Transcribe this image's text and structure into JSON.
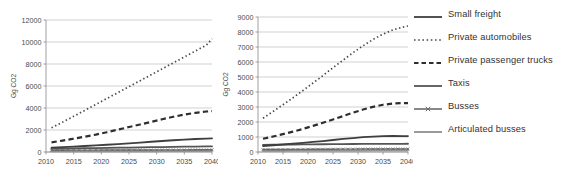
{
  "figure": {
    "panels": [
      {
        "id": "left",
        "ylabel": "Gg CO2",
        "ylim": [
          0,
          12000
        ],
        "yticks": [
          "0",
          "2000",
          "4000",
          "6000",
          "8000",
          "10000",
          "12000"
        ],
        "ytick_values": [
          0,
          2000,
          4000,
          6000,
          8000,
          10000,
          12000
        ],
        "xticks": [
          "2010",
          "2015",
          "2020",
          "2025",
          "2030",
          "2035",
          "2040"
        ],
        "xtick_values": [
          2010,
          2015,
          2020,
          2025,
          2030,
          2035,
          2040
        ],
        "xlim": [
          2010,
          2040
        ]
      },
      {
        "id": "right",
        "ylabel": "Gg CO2",
        "ylim": [
          0,
          9000
        ],
        "yticks": [
          "0",
          "1000",
          "2000",
          "3000",
          "4000",
          "5000",
          "6000",
          "7000",
          "8000",
          "9000"
        ],
        "ytick_values": [
          0,
          1000,
          2000,
          3000,
          4000,
          5000,
          6000,
          7000,
          8000,
          9000
        ],
        "xticks": [
          "2010",
          "2015",
          "2020",
          "2025",
          "2030",
          "2035",
          "2040"
        ],
        "xtick_values": [
          2010,
          2015,
          2020,
          2025,
          2030,
          2035,
          2040
        ],
        "xlim": [
          2010,
          2040
        ]
      }
    ]
  },
  "legend": {
    "position": "right",
    "items": [
      {
        "label": "Small freight",
        "style": "solid",
        "color": "#3f3f3f",
        "width": 1.8,
        "marker": "none"
      },
      {
        "label": "Private automobiles",
        "style": "dotted",
        "color": "#4a4a4a",
        "width": 1.7,
        "marker": "none"
      },
      {
        "label": "Private passenger trucks",
        "style": "dashed",
        "color": "#2e2e2e",
        "width": 2.2,
        "marker": "none"
      },
      {
        "label": "Taxis",
        "style": "solid",
        "color": "#555555",
        "width": 1.8,
        "marker": "none"
      },
      {
        "label": "Busses",
        "style": "solid",
        "color": "#6b6b6b",
        "width": 1.4,
        "marker": "cross"
      },
      {
        "label": "Articulated busses",
        "style": "solid",
        "color": "#9a9a9a",
        "width": 2.0,
        "marker": "none"
      }
    ]
  },
  "chart_data": [
    {
      "type": "line",
      "panel": "left",
      "title": "",
      "xlabel": "",
      "ylabel": "Gg CO2",
      "xlim": [
        2010,
        2040
      ],
      "ylim": [
        0,
        12000
      ],
      "grid": true,
      "legend_position": "right",
      "x": [
        2011,
        2013,
        2015,
        2017,
        2019,
        2021,
        2023,
        2025,
        2027,
        2029,
        2031,
        2033,
        2035,
        2037,
        2039,
        2040
      ],
      "series": [
        {
          "name": "Private automobiles",
          "values": [
            2200,
            2720,
            3240,
            3780,
            4320,
            4860,
            5400,
            5940,
            6480,
            7020,
            7560,
            8100,
            8640,
            9180,
            9720,
            10300
          ]
        },
        {
          "name": "Private passenger trucks",
          "values": [
            880,
            1040,
            1210,
            1390,
            1580,
            1800,
            2030,
            2270,
            2500,
            2740,
            2980,
            3200,
            3400,
            3560,
            3680,
            3720
          ]
        },
        {
          "name": "Small freight",
          "values": [
            390,
            440,
            490,
            545,
            600,
            660,
            720,
            790,
            860,
            930,
            1000,
            1070,
            1130,
            1180,
            1220,
            1240
          ]
        },
        {
          "name": "Taxis",
          "values": [
            300,
            315,
            330,
            345,
            360,
            375,
            390,
            405,
            420,
            435,
            450,
            465,
            480,
            495,
            505,
            510
          ]
        },
        {
          "name": "Busses",
          "values": [
            160,
            163,
            166,
            169,
            172,
            175,
            178,
            181,
            184,
            187,
            190,
            193,
            196,
            199,
            201,
            202
          ]
        },
        {
          "name": "Articulated busses",
          "values": [
            60,
            62,
            64,
            66,
            68,
            70,
            72,
            74,
            76,
            78,
            80,
            82,
            84,
            86,
            88,
            89
          ]
        }
      ]
    },
    {
      "type": "line",
      "panel": "right",
      "title": "",
      "xlabel": "",
      "ylabel": "Gg CO2",
      "xlim": [
        2010,
        2040
      ],
      "ylim": [
        0,
        9000
      ],
      "grid": true,
      "legend_position": "right",
      "x": [
        2011,
        2013,
        2015,
        2017,
        2019,
        2021,
        2023,
        2025,
        2027,
        2029,
        2031,
        2033,
        2035,
        2037,
        2039,
        2040
      ],
      "series": [
        {
          "name": "Private automobiles",
          "values": [
            2250,
            2700,
            3150,
            3620,
            4100,
            4600,
            5100,
            5620,
            6120,
            6620,
            7080,
            7500,
            7860,
            8140,
            8330,
            8400
          ]
        },
        {
          "name": "Private passenger trucks",
          "values": [
            880,
            1030,
            1190,
            1360,
            1540,
            1740,
            1950,
            2170,
            2390,
            2620,
            2830,
            3010,
            3150,
            3230,
            3260,
            3260
          ]
        },
        {
          "name": "Small freight",
          "values": [
            400,
            450,
            500,
            555,
            610,
            670,
            730,
            800,
            870,
            930,
            985,
            1030,
            1060,
            1070,
            1065,
            1060
          ]
        },
        {
          "name": "Taxis",
          "values": [
            480,
            487,
            494,
            500,
            506,
            512,
            518,
            523,
            528,
            532,
            536,
            540,
            543,
            546,
            548,
            549
          ]
        },
        {
          "name": "Busses",
          "values": [
            165,
            168,
            171,
            174,
            177,
            180,
            183,
            186,
            189,
            192,
            195,
            198,
            200,
            202,
            203,
            204
          ]
        },
        {
          "name": "Articulated busses",
          "values": [
            70,
            72,
            74,
            76,
            78,
            80,
            82,
            84,
            86,
            88,
            90,
            92,
            94,
            95,
            96,
            97
          ]
        }
      ]
    }
  ]
}
